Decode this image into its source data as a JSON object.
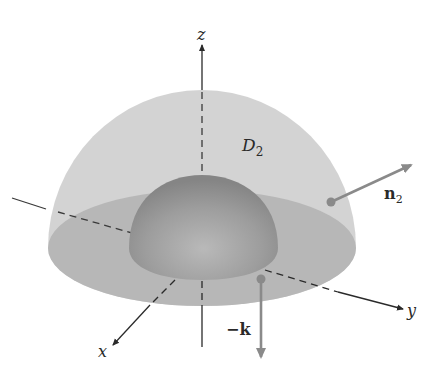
{
  "figure": {
    "type": "3d-surface-diagram",
    "axes": {
      "x_label": "x",
      "y_label": "y",
      "z_label": "z"
    },
    "region_label": {
      "base": "D",
      "subscript": "2"
    },
    "vectors": [
      {
        "id": "n2",
        "label_base": "n",
        "label_subscript": "2",
        "direction": "outward normal on outer hemisphere"
      },
      {
        "id": "neg-k",
        "label": "−k",
        "direction": "downward normal on flat base"
      }
    ],
    "colors": {
      "outer_hemisphere": "#c9c9c9",
      "base_disk": "#b5b5b5",
      "inner_hemisphere": "#9a9a9a",
      "vector": "#8a8a8a",
      "axis": "#2a2a2a"
    }
  }
}
